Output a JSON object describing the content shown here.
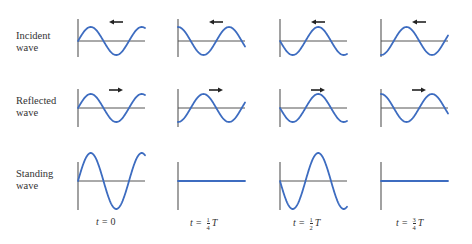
{
  "diagram": {
    "rows": [
      {
        "key": "incident",
        "label_line1": "Incident",
        "label_line2": "wave",
        "direction": "left"
      },
      {
        "key": "reflected",
        "label_line1": "Reflected",
        "label_line2": "wave",
        "direction": "right"
      },
      {
        "key": "standing",
        "label_line1": "Standing",
        "label_line2": "wave",
        "direction": "none"
      }
    ],
    "columns": [
      {
        "t_prefix": "t = ",
        "t_value": "0",
        "frac_num": "",
        "frac_den": "",
        "t_suffix": ""
      },
      {
        "t_prefix": "t = ",
        "t_value": "",
        "frac_num": "1",
        "frac_den": "4",
        "t_suffix": "T"
      },
      {
        "t_prefix": "t = ",
        "t_value": "",
        "frac_num": "1",
        "frac_den": "2",
        "t_suffix": "T"
      },
      {
        "t_prefix": "t = ",
        "t_value": "",
        "frac_num": "3",
        "frac_den": "4",
        "t_suffix": "T"
      }
    ],
    "colors": {
      "wave": "#3d6cc0",
      "axis": "#555555",
      "arrow": "#222222",
      "text": "#333333"
    }
  }
}
